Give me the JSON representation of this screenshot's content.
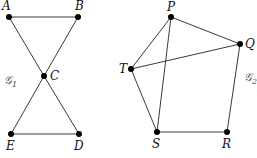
{
  "graphs": [
    {
      "id": "G1",
      "label": "𝒢",
      "subscript": "1",
      "label_pos": [
        4,
        84
      ],
      "vertices": [
        {
          "name": "A",
          "x": 9,
          "y": 17,
          "lx": 2,
          "ly": 10
        },
        {
          "name": "B",
          "x": 78,
          "y": 17,
          "lx": 75,
          "ly": 10
        },
        {
          "name": "C",
          "x": 44,
          "y": 76,
          "lx": 50,
          "ly": 80
        },
        {
          "name": "E",
          "x": 11,
          "y": 134,
          "lx": 6,
          "ly": 150
        },
        {
          "name": "D",
          "x": 79,
          "y": 134,
          "lx": 74,
          "ly": 150
        }
      ],
      "edges": [
        [
          "A",
          "B"
        ],
        [
          "A",
          "C"
        ],
        [
          "B",
          "C"
        ],
        [
          "C",
          "E"
        ],
        [
          "C",
          "D"
        ],
        [
          "E",
          "D"
        ]
      ]
    },
    {
      "id": "G2",
      "label": "𝒢",
      "subscript": "2",
      "label_pos": [
        244,
        81
      ],
      "vertices": [
        {
          "name": "P",
          "x": 171,
          "y": 17,
          "lx": 167,
          "ly": 11
        },
        {
          "name": "Q",
          "x": 240,
          "y": 44,
          "lx": 245,
          "ly": 48
        },
        {
          "name": "T",
          "x": 131,
          "y": 69,
          "lx": 119,
          "ly": 73
        },
        {
          "name": "S",
          "x": 157,
          "y": 132,
          "lx": 152,
          "ly": 148
        },
        {
          "name": "R",
          "x": 227,
          "y": 132,
          "lx": 222,
          "ly": 148
        }
      ],
      "edges": [
        [
          "P",
          "Q"
        ],
        [
          "P",
          "T"
        ],
        [
          "P",
          "S"
        ],
        [
          "T",
          "Q"
        ],
        [
          "T",
          "S"
        ],
        [
          "S",
          "R"
        ],
        [
          "R",
          "Q"
        ]
      ]
    }
  ]
}
